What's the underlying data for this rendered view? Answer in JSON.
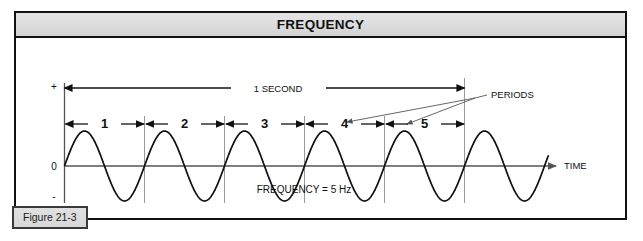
{
  "figure": {
    "title": "FREQUENCY",
    "caption": "Figure 21-3",
    "labels": {
      "duration": "1 SECOND",
      "periods": "PERIODS",
      "time_axis": "TIME",
      "frequency_note": "FREQUENCY = 5 Hz",
      "axis_plus": "+",
      "axis_zero": "0",
      "axis_minus": "-"
    },
    "period_numbers": [
      "1",
      "2",
      "3",
      "4",
      "5"
    ],
    "colors": {
      "frame": "#111111",
      "title_band": "#dcdcdc",
      "wave": "#111111",
      "divider": "#9a9a9a",
      "caption_bg": "#d8d8d8"
    }
  },
  "chart_data": {
    "type": "line",
    "title": "FREQUENCY",
    "xlabel": "TIME",
    "ylabel": "",
    "annotations": [
      "1 SECOND",
      "PERIODS",
      "FREQUENCY = 5 Hz"
    ],
    "series": [
      {
        "name": "sine wave",
        "waveform": "sine",
        "frequency_hz": 5,
        "cycles_shown": 6.05,
        "amplitude": 1,
        "phase": 0
      }
    ],
    "ytick_labels": [
      "+",
      "0",
      "-"
    ],
    "ylim": [
      -1,
      1
    ],
    "xlim": [
      0,
      1.21
    ],
    "x_unit": "seconds",
    "period_markers": [
      "1",
      "2",
      "3",
      "4",
      "5"
    ],
    "period_duration_s": 0.2,
    "grid": false,
    "legend": false
  }
}
